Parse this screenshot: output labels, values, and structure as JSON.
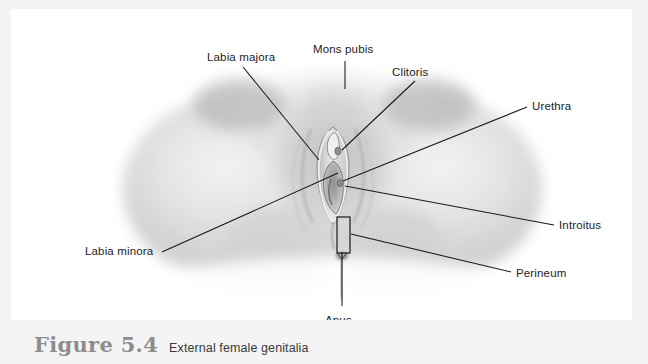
{
  "figure": {
    "caption_number": "Figure 5.4",
    "caption_text": "External female genitalia",
    "alt_description": "Grayscale anatomical illustration of the external female genitalia viewed from below, with leader lines labelling seven structures.",
    "panel_background": "#ffffff",
    "page_background": "#f4f4f4",
    "line_color": "#17181a",
    "label_color": "#1d1d1d",
    "caption_number_color": "#8d8d8d",
    "caption_text_color": "#3a3a3a"
  },
  "labels": [
    {
      "id": "labia-majora",
      "text": "Labia majora",
      "x": 196,
      "y": 52,
      "anchor": "start"
    },
    {
      "id": "mons-pubis",
      "text": "Mons pubis",
      "x": 302,
      "y": 44,
      "anchor": "start"
    },
    {
      "id": "clitoris",
      "text": "Clitoris",
      "x": 381,
      "y": 67,
      "anchor": "start"
    },
    {
      "id": "urethra",
      "text": "Urethra",
      "x": 521,
      "y": 101,
      "anchor": "start"
    },
    {
      "id": "introitus",
      "text": "Introitus",
      "x": 548,
      "y": 220,
      "anchor": "start"
    },
    {
      "id": "perineum",
      "text": "Perineum",
      "x": 505,
      "y": 268,
      "anchor": "start"
    },
    {
      "id": "labia-minora",
      "text": "Labia minora",
      "x": 74,
      "y": 246,
      "anchor": "start"
    },
    {
      "id": "anus",
      "text": "Anus",
      "x": 314,
      "y": 315,
      "anchor": "start"
    }
  ],
  "leaders": [
    {
      "id": "leader-labia-majora",
      "path": "M 232,58 L 308,151"
    },
    {
      "id": "leader-mons-pubis",
      "path": "M 334,52 L 334,80"
    },
    {
      "id": "leader-clitoris",
      "path": "M 404,72 L 331,141"
    },
    {
      "id": "leader-urethra",
      "path": "M 516,98 L 332,172"
    },
    {
      "id": "leader-introitus",
      "path": "M 543,216 L 334,177"
    },
    {
      "id": "leader-perineum",
      "path": "M 500,263 L 340,225"
    },
    {
      "id": "leader-labia-minora",
      "path": "M 151,243 L 327,164"
    },
    {
      "id": "leader-anus",
      "path": "M 331,243 L 331,297"
    }
  ],
  "annotations": {
    "perineum_bracket": {
      "x": 326,
      "y": 208,
      "width": 13,
      "height": 36
    }
  }
}
